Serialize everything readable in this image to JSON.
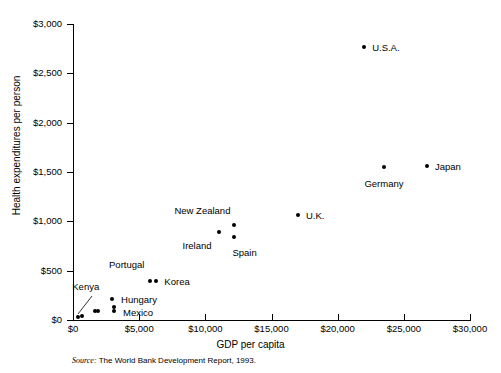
{
  "chart_data": {
    "type": "scatter",
    "title": "",
    "xlabel": "GDP per capita",
    "ylabel": "Health expenditures per person",
    "xlim": [
      0,
      30000
    ],
    "ylim": [
      0,
      3000
    ],
    "xticks": [
      "$0",
      "$5,000",
      "$10,000",
      "$15,000",
      "$20,000",
      "$25,000",
      "$30,000"
    ],
    "xtick_values": [
      0,
      5000,
      10000,
      15000,
      20000,
      25000,
      30000
    ],
    "yticks": [
      "$0",
      "$500",
      "$1,000",
      "$1,500",
      "$2,000",
      "$2,500",
      "$3,000"
    ],
    "ytick_values": [
      0,
      500,
      1000,
      1500,
      2000,
      2500,
      3000
    ],
    "grid": false,
    "legend": "none",
    "marker_color": "#000000",
    "points": [
      {
        "label": "Kenya",
        "x": 400,
        "y": 30,
        "label_dx": -6,
        "label_dy": -30,
        "label_anchor": "start",
        "leader": true
      },
      {
        "label": "",
        "x": 700,
        "y": 40,
        "label_dx": 0,
        "label_dy": 0,
        "label_anchor": "start",
        "leader": false
      },
      {
        "label": "",
        "x": 1650,
        "y": 90,
        "label_dx": 0,
        "label_dy": 0,
        "label_anchor": "start",
        "leader": false
      },
      {
        "label": "",
        "x": 1900,
        "y": 90,
        "label_dx": 0,
        "label_dy": 0,
        "label_anchor": "start",
        "leader": false
      },
      {
        "label": "Hungary",
        "x": 2950,
        "y": 215,
        "label_dx": 9,
        "label_dy": 1,
        "label_anchor": "start",
        "leader": false
      },
      {
        "label": "",
        "x": 3100,
        "y": 130,
        "label_dx": 0,
        "label_dy": 0,
        "label_anchor": "start",
        "leader": false
      },
      {
        "label": "Mexico",
        "x": 3100,
        "y": 95,
        "label_dx": 9,
        "label_dy": 2,
        "label_anchor": "start",
        "leader": false
      },
      {
        "label": "Portugal",
        "x": 5850,
        "y": 395,
        "label_dx": -6,
        "label_dy": -16,
        "label_anchor": "end",
        "leader": false
      },
      {
        "label": "Korea",
        "x": 6300,
        "y": 395,
        "label_dx": 8,
        "label_dy": 1,
        "label_anchor": "start",
        "leader": false
      },
      {
        "label": "Ireland",
        "x": 11000,
        "y": 890,
        "label_dx": -7,
        "label_dy": 14,
        "label_anchor": "end",
        "leader": false
      },
      {
        "label": "New Zealand",
        "x": 12200,
        "y": 960,
        "label_dx": -4,
        "label_dy": -14,
        "label_anchor": "end",
        "leader": false
      },
      {
        "label": "Spain",
        "x": 12200,
        "y": 845,
        "label_dx": -2,
        "label_dy": 16,
        "label_anchor": "start",
        "leader": false
      },
      {
        "label": "U.K.",
        "x": 17000,
        "y": 1065,
        "label_dx": 8,
        "label_dy": 1,
        "label_anchor": "start",
        "leader": false
      },
      {
        "label": "U.S.A.",
        "x": 22000,
        "y": 2765,
        "label_dx": 8,
        "label_dy": 1,
        "label_anchor": "start",
        "leader": false
      },
      {
        "label": "Germany",
        "x": 23500,
        "y": 1555,
        "label_dx": 0,
        "label_dy": 17,
        "label_anchor": "middle",
        "leader": false
      },
      {
        "label": "Japan",
        "x": 26750,
        "y": 1560,
        "label_dx": 8,
        "label_dy": 1,
        "label_anchor": "start",
        "leader": false
      }
    ]
  },
  "source": {
    "word": "Source:",
    "text": " The World Bank Development Report, 1993."
  }
}
